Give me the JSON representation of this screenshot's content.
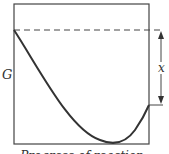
{
  "diagram": {
    "y_axis_label": "G",
    "x_axis_label": "Progress of reaction",
    "interval_label": "x",
    "colors": {
      "line": "#333333",
      "background": "#ffffff"
    }
  }
}
